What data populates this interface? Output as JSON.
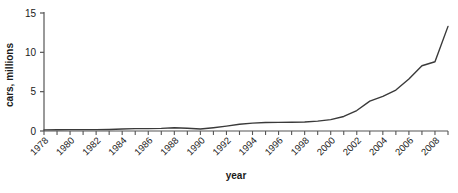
{
  "chart_data": {
    "type": "line",
    "title": "",
    "xlabel": "year",
    "ylabel": "cars, millions",
    "xlim": [
      1978,
      2009
    ],
    "ylim": [
      0,
      15
    ],
    "grid": false,
    "legend": null,
    "y_ticks": [
      0,
      5,
      10,
      15
    ],
    "x_ticks_labeled": [
      1978,
      1980,
      1982,
      1984,
      1986,
      1988,
      1990,
      1992,
      1994,
      1996,
      1998,
      2000,
      2002,
      2004,
      2006,
      2008
    ],
    "x_ticks_minor": [
      1979,
      1981,
      1983,
      1985,
      1987,
      1989,
      1991,
      1993,
      1995,
      1997,
      1999,
      2001,
      2003,
      2005,
      2007,
      2009
    ],
    "x": [
      1978,
      1979,
      1980,
      1981,
      1982,
      1983,
      1984,
      1985,
      1986,
      1987,
      1988,
      1989,
      1990,
      1991,
      1992,
      1993,
      1994,
      1995,
      1996,
      1997,
      1998,
      1999,
      2000,
      2001,
      2002,
      2003,
      2004,
      2005,
      2006,
      2007,
      2008,
      2009
    ],
    "series": [
      {
        "name": "cars",
        "color": "#3a3a3a",
        "values": [
          0.14,
          0.16,
          0.18,
          0.17,
          0.18,
          0.2,
          0.25,
          0.3,
          0.3,
          0.33,
          0.42,
          0.35,
          0.25,
          0.42,
          0.62,
          0.85,
          1.0,
          1.08,
          1.1,
          1.12,
          1.15,
          1.25,
          1.45,
          1.85,
          2.6,
          3.8,
          4.4,
          5.2,
          6.6,
          8.3,
          8.8,
          13.3
        ]
      }
    ]
  },
  "axis_labels": {
    "y_title": "cars, millions",
    "x_title": "year"
  },
  "colors": {
    "line": "#3a3a3a",
    "axis": "#555555",
    "text": "#1a1a1a",
    "background": "#ffffff"
  }
}
